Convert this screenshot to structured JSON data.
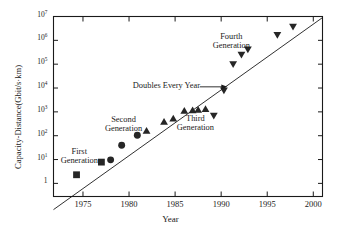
{
  "chart_data": {
    "type": "scatter",
    "title": "",
    "xlabel": "Year",
    "ylabel": "Capacity-Distance(Gbit/s·km)",
    "xlim": [
      1971.8,
      2001.0
    ],
    "ylim_log10": [
      -0.55,
      7.0
    ],
    "yscale": "log",
    "xticks": [
      1975,
      1980,
      1985,
      1990,
      1995,
      2000
    ],
    "xtick_labels": [
      "1975",
      "1980",
      "1985",
      "1990",
      "1995",
      "2000"
    ],
    "yticks_log10": [
      0,
      1,
      2,
      3,
      4,
      5,
      6,
      7
    ],
    "ytick_labels": [
      "1",
      "10",
      "10",
      "10",
      "10",
      "10",
      "10",
      "10"
    ],
    "ytick_exponents": [
      "",
      "1",
      "2",
      "3",
      "4",
      "5",
      "6",
      "7"
    ],
    "grid": false,
    "legend": "none",
    "trend_line": {
      "label": "Doubles Every Year",
      "slope_per_year_log10": 0.301,
      "points": [
        [
          1971.8,
          0.0794
        ],
        [
          2001.0,
          9000000.0
        ]
      ]
    },
    "series": [
      {
        "name": "First Generation",
        "marker": "square",
        "color": "#262626",
        "points": [
          {
            "x": 1974.3,
            "y": 2.3
          },
          {
            "x": 1977.0,
            "y": 7.8
          }
        ]
      },
      {
        "name": "Second Generation",
        "marker": "circle",
        "color": "#262626",
        "points": [
          {
            "x": 1978.0,
            "y": 9.7
          },
          {
            "x": 1979.2,
            "y": 40
          },
          {
            "x": 1980.9,
            "y": 105
          }
        ]
      },
      {
        "name": "Third Generation",
        "marker": "triangle-up",
        "color": "#262626",
        "points": [
          {
            "x": 1981.9,
            "y": 160
          },
          {
            "x": 1983.8,
            "y": 380
          },
          {
            "x": 1984.8,
            "y": 520
          },
          {
            "x": 1986.0,
            "y": 1100
          },
          {
            "x": 1986.9,
            "y": 1150
          },
          {
            "x": 1987.5,
            "y": 1200
          },
          {
            "x": 1988.3,
            "y": 1300
          }
        ]
      },
      {
        "name": "Fourth Generation",
        "marker": "triangle-down",
        "color": "#262626",
        "points": [
          {
            "x": 1989.2,
            "y": 700
          },
          {
            "x": 1990.3,
            "y": 8000
          },
          {
            "x": 1991.3,
            "y": 100000
          },
          {
            "x": 1992.2,
            "y": 250000
          },
          {
            "x": 1992.9,
            "y": 420000
          },
          {
            "x": 1996.1,
            "y": 1700000
          },
          {
            "x": 1997.8,
            "y": 3800000
          }
        ]
      }
    ],
    "annotations": [
      {
        "id": "first-generation",
        "text_lines": [
          "First",
          "Generation"
        ],
        "x": 1974.6,
        "y_log10": 1.05
      },
      {
        "id": "second-generation",
        "text_lines": [
          "Second",
          "Generation"
        ],
        "x": 1979.4,
        "y_log10": 2.42
      },
      {
        "id": "third-generation",
        "text_lines": [
          "Third",
          "Generation"
        ],
        "x": 1987.2,
        "y_log10": 2.45
      },
      {
        "id": "fourth-generation",
        "text_lines": [
          "Fourth",
          "Generation"
        ],
        "x": 1991.1,
        "y_log10": 5.9
      },
      {
        "id": "doubles-every-year",
        "text_lines": [
          "Doubles Every Year"
        ],
        "x": 1984.1,
        "y_log10": 4.05,
        "arrow": true
      }
    ]
  }
}
